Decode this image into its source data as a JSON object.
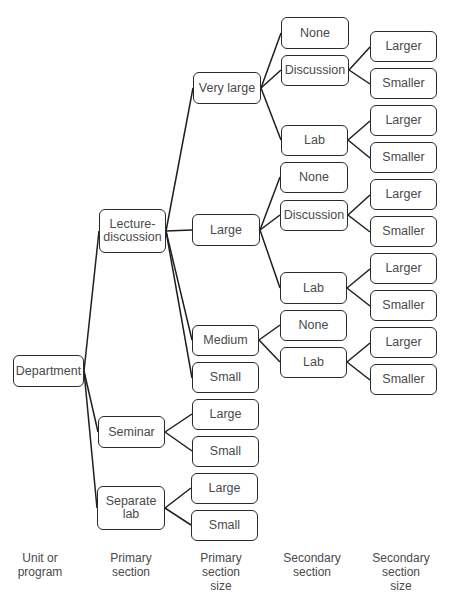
{
  "diagram": {
    "type": "tree",
    "nodes": {
      "department": "Department",
      "lecture_discussion": "Lecture-\ndiscussion",
      "seminar": "Seminar",
      "separate_lab": "Separate\nlab",
      "ld_very_large": "Very large",
      "ld_large": "Large",
      "ld_medium": "Medium",
      "ld_small": "Small",
      "sem_large": "Large",
      "sem_small": "Small",
      "sl_large": "Large",
      "sl_small": "Small",
      "vl_none": "None",
      "vl_discussion": "Discussion",
      "vl_lab": "Lab",
      "lg_none": "None",
      "lg_discussion": "Discussion",
      "lg_lab": "Lab",
      "md_none": "None",
      "md_lab": "Lab",
      "vl_disc_larger": "Larger",
      "vl_disc_smaller": "Smaller",
      "vl_lab_larger": "Larger",
      "vl_lab_smaller": "Smaller",
      "lg_disc_larger": "Larger",
      "lg_disc_smaller": "Smaller",
      "lg_lab_larger": "Larger",
      "lg_lab_smaller": "Smaller",
      "md_lab_larger": "Larger",
      "md_lab_smaller": "Smaller"
    },
    "column_labels": [
      "Unit or\nprogram",
      "Primary\nsection",
      "Primary\nsection\nsize",
      "Secondary\nsection",
      "Secondary\nsection\nsize"
    ]
  }
}
